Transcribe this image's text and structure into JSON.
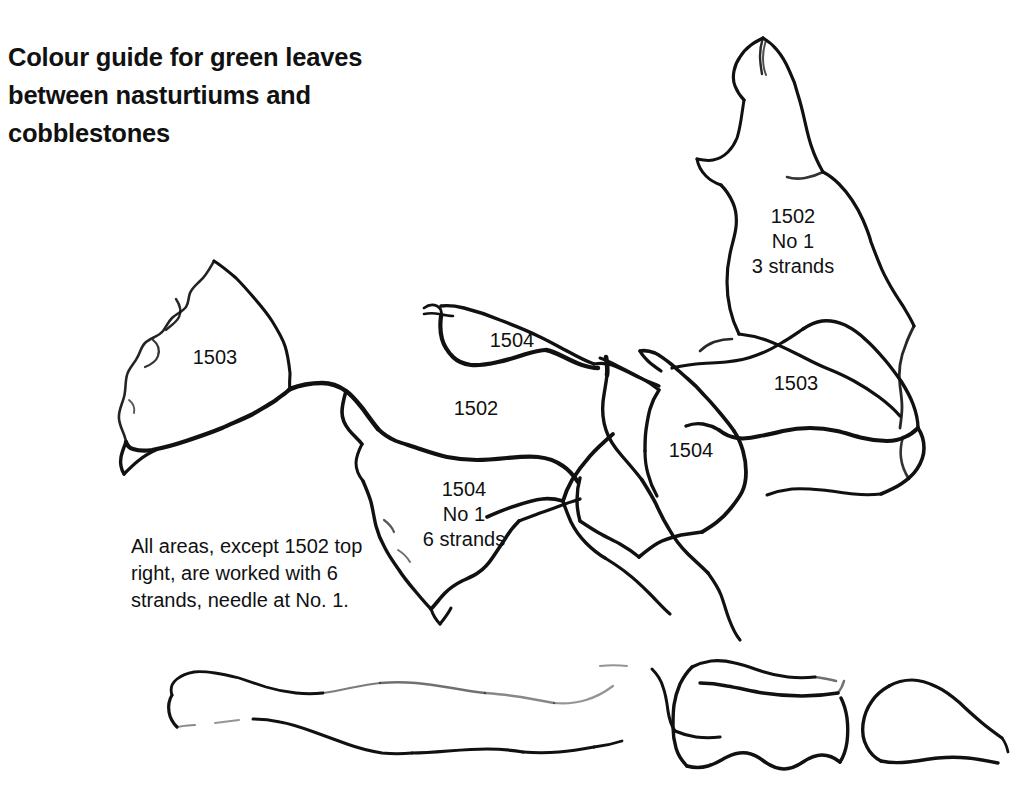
{
  "page": {
    "background_color": "#ffffff",
    "ink_color": "#111111",
    "width": 1016,
    "height": 799
  },
  "title": {
    "text": "Colour guide for green leaves\nbetween nasturtiums and\ncobblestones"
  },
  "note": {
    "text": "All areas, except 1502 top\nright, are worked with 6\nstrands, needle at No. 1."
  },
  "region_labels": [
    {
      "id": "left-leaf-1503",
      "text": "1503",
      "x": 215,
      "y": 345
    },
    {
      "id": "upper-middle-1504",
      "text": "1504",
      "x": 512,
      "y": 328
    },
    {
      "id": "middle-1502",
      "text": "1502",
      "x": 476,
      "y": 396
    },
    {
      "id": "lower-middle-1504-no1",
      "text": "1504\nNo 1\n6 strands",
      "x": 464,
      "y": 477
    },
    {
      "id": "right-middle-1504",
      "text": "1504",
      "x": 691,
      "y": 438
    },
    {
      "id": "right-1503",
      "text": "1503",
      "x": 796,
      "y": 371
    },
    {
      "id": "top-right-1502-no1",
      "text": "1502\nNo 1\n3 strands",
      "x": 793,
      "y": 204
    }
  ],
  "legend_codes": [
    "1502",
    "1503",
    "1504"
  ],
  "strand_counts": [
    "3 strands",
    "6 strands"
  ],
  "needle": "No 1"
}
